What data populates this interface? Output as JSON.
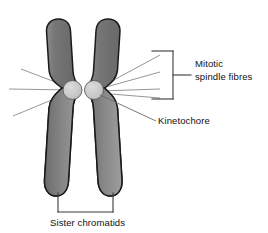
{
  "figure": {
    "name": "mitotic-chromosome-diagram",
    "background_color": "#ffffff",
    "width": 268,
    "height": 233
  },
  "colors": {
    "chromatid_fill_dark": "#6e6e6e",
    "chromatid_fill_light": "#a9a9a9",
    "chromatid_outline": "#1a1a1a",
    "kinetochore_fill": "#c9c9c9",
    "kinetochore_outline": "#4a4a4a",
    "fibre_line": "#8a8a8a",
    "bracket_line": "#3a3a3a",
    "leader_line": "#6a6a6a",
    "text": "#111111"
  },
  "labels": {
    "mitotic_spindle_fibres": {
      "line1": "Mitotic",
      "line2": "spindle fibres"
    },
    "kinetochore": "Kinetochore",
    "sister_chromatids": "Sister chromatids"
  },
  "structures": {
    "left_chromatid": "left-sister-chromatid",
    "right_chromatid": "right-sister-chromatid",
    "left_kinetochore": "left-kinetochore-disc",
    "right_kinetochore": "right-kinetochore-disc",
    "centromere": "centromere-constriction"
  },
  "spindle_fibres": {
    "left_count": 3,
    "right_count": 4,
    "total_count": 7
  },
  "annotations": {
    "spindle_bracket": "right-side-vertical-bracket",
    "chromatid_bracket": "bottom-u-bracket",
    "kinetochore_leader": "kinetochore-leader-line"
  }
}
